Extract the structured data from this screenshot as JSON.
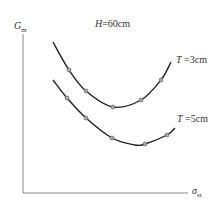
{
  "chart_data": {
    "type": "line",
    "title": "H=60cm",
    "xlabel": "σst",
    "ylabel": "Gm",
    "grid": false,
    "legend_position": "inline-right",
    "series": [
      {
        "name": "T=3cm",
        "points_px": [
          [
            53,
            42
          ],
          [
            69,
            70
          ],
          [
            86,
            91
          ],
          [
            113,
            107
          ],
          [
            141,
            100
          ],
          [
            161,
            80
          ],
          [
            171,
            62
          ]
        ],
        "markers_px": [
          [
            69,
            70
          ],
          [
            86,
            91
          ],
          [
            113,
            107
          ],
          [
            141,
            100
          ],
          [
            161,
            80
          ]
        ]
      },
      {
        "name": "T=5cm",
        "points_px": [
          [
            53,
            80
          ],
          [
            67,
            98
          ],
          [
            86,
            118
          ],
          [
            112,
            138
          ],
          [
            135,
            145
          ],
          [
            145,
            144
          ],
          [
            167,
            135
          ],
          [
            175,
            128
          ]
        ],
        "markers_px": [
          [
            67,
            98
          ],
          [
            86,
            118
          ],
          [
            112,
            138
          ],
          [
            145,
            144
          ],
          [
            167,
            135
          ]
        ]
      }
    ]
  },
  "labels": {
    "title_var": "H",
    "title_val": "=60cm",
    "y_main": "G",
    "y_sub": "m",
    "x_main": "σ",
    "x_sub": "st",
    "s1_var": "T",
    "s1_val": " =3cm",
    "s2_var": "T",
    "s2_val": " =5cm"
  }
}
